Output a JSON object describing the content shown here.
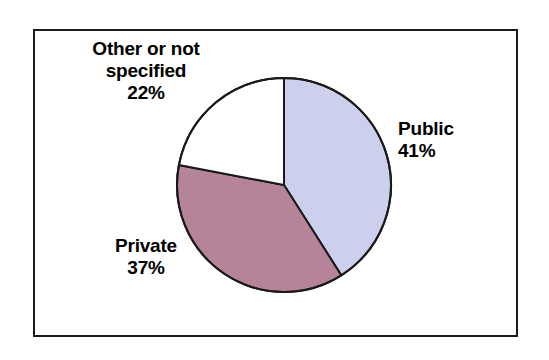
{
  "chart_data": {
    "type": "pie",
    "title": "",
    "subtitle": "",
    "xlabel": "",
    "ylabel": "",
    "legend_position": "none",
    "grid": false,
    "start_angle_deg": 0,
    "direction": "clockwise",
    "categories": [
      "Public",
      "Private",
      "Other or not specified"
    ],
    "values": [
      41,
      37,
      22
    ],
    "value_suffix": "%",
    "colors": [
      "#ccd0ec",
      "#b58499",
      "#ffffff"
    ],
    "slice_outline_color": "#1a1a1a",
    "slices": [
      {
        "label": "Public",
        "value": 41,
        "value_text": "41%",
        "color": "#ccd0ec",
        "start_deg": 0,
        "end_deg": 147.6
      },
      {
        "label": "Private",
        "value": 37,
        "value_text": "37%",
        "color": "#b58499",
        "start_deg": 147.6,
        "end_deg": 280.8
      },
      {
        "label": "Other or not specified",
        "value": 22,
        "value_text": "22%",
        "color": "#ffffff",
        "start_deg": 280.8,
        "end_deg": 360
      }
    ]
  },
  "labels": {
    "other": {
      "name": "Other or not specified",
      "value": "22%"
    },
    "public": {
      "name": "Public",
      "value": "41%"
    },
    "private": {
      "name": "Private",
      "value": "37%"
    }
  },
  "style": {
    "frame_border_color": "#1a1a1a",
    "background": "#ffffff",
    "text_color": "#000000"
  }
}
